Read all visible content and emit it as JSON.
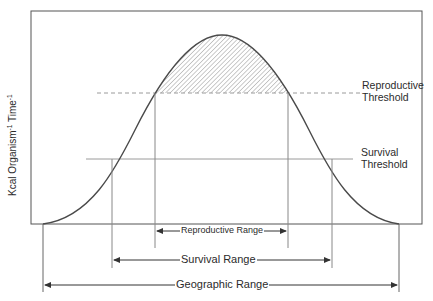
{
  "diagram": {
    "type": "tolerance-curve",
    "y_axis": {
      "label_part1": "Kcal Organism",
      "sup1": "-1",
      "label_part2": " Time",
      "sup2": "-1"
    },
    "thresholds": {
      "reproductive": {
        "line1": "Reproductive",
        "line2": "Threshold",
        "style": "dashed"
      },
      "survival": {
        "line1": "Survival",
        "line2": "Threshold",
        "style": "solid"
      }
    },
    "ranges": {
      "reproductive": "Reproductive Range",
      "survival": "Survival Range",
      "geographic": "Geographic Range"
    },
    "shaded_region": "area under curve above reproductive threshold (hatched)",
    "colors": {
      "line": "#4a4a4a",
      "frame": "#555555",
      "dashed": "#9a9a9a",
      "hatch": "#8a8a8a",
      "text": "#2b2b2b"
    }
  }
}
